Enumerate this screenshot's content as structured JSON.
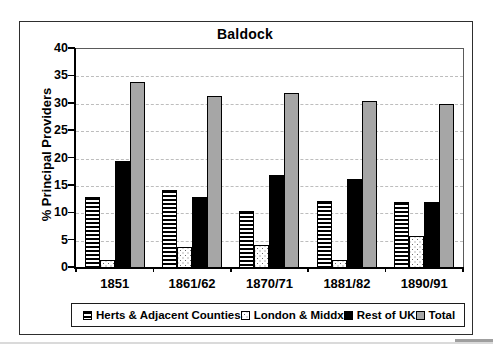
{
  "page": {
    "background": "#ffffff"
  },
  "chart_data": {
    "type": "bar",
    "title": "Baldock",
    "xlabel": "",
    "ylabel": "% Principal Providers",
    "ylim": [
      0,
      40
    ],
    "yticks": [
      0,
      5,
      10,
      15,
      20,
      25,
      30,
      35,
      40
    ],
    "grid": "horizontal-dashed",
    "legend_position": "bottom",
    "categories": [
      "1851",
      "1861/62",
      "1870/71",
      "1881/82",
      "1890/91"
    ],
    "series": [
      {
        "name": "Herts & Adjacent Counties",
        "pattern": "horizontal-stripes",
        "css": "p-stripes",
        "values": [
          13,
          14.2,
          10.5,
          12.3,
          12
        ]
      },
      {
        "name": "London & Middx",
        "pattern": "stipple-dots",
        "css": "p-dots",
        "values": [
          1.5,
          3.8,
          4.2,
          1.5,
          5.8
        ]
      },
      {
        "name": "Rest of UK",
        "pattern": "solid",
        "color": "#000000",
        "css": "p-black",
        "values": [
          19.5,
          13,
          17,
          16.3,
          12
        ]
      },
      {
        "name": "Total",
        "pattern": "solid",
        "color": "#a6a6a6",
        "css": "p-gray",
        "values": [
          34,
          31.5,
          32,
          30.5,
          30
        ]
      }
    ]
  }
}
